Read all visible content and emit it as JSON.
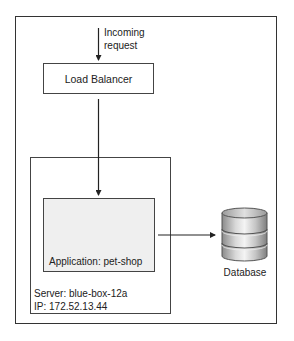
{
  "diagram": {
    "incoming": {
      "line1": "Incoming",
      "line2": "request"
    },
    "load_balancer": {
      "label": "Load Balancer"
    },
    "server": {
      "name_line": "Server: blue-box-12a",
      "ip_line": "IP: 172.52.13.44"
    },
    "application": {
      "label": "Application: pet-shop"
    },
    "database": {
      "label": "Database",
      "icon": "database-cylinder-icon"
    },
    "colors": {
      "line": "#333333",
      "app_fill": "#efefef",
      "db_body": "#b5b5b5",
      "db_highlight": "#f2f2f2"
    },
    "edges": [
      {
        "from": "incoming",
        "to": "load_balancer"
      },
      {
        "from": "load_balancer",
        "to": "application"
      },
      {
        "from": "application",
        "to": "database"
      }
    ]
  }
}
